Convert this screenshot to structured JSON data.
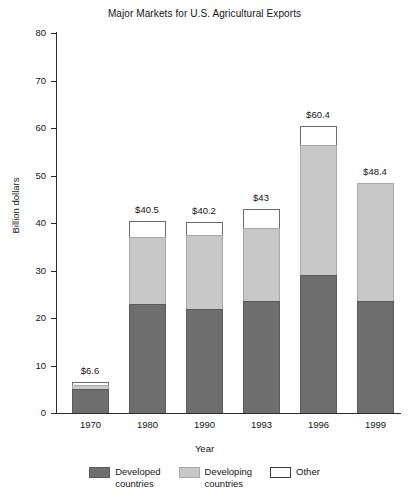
{
  "chart_data": {
    "type": "bar",
    "title": "Major Markets for U.S. Agricultural Exports",
    "xlabel": "Year",
    "ylabel": "Billion dollars",
    "ylim": [
      0,
      80
    ],
    "ytick_step": 10,
    "yticks": [
      "80",
      "70",
      "60",
      "50",
      "40",
      "30",
      "20",
      "10",
      "0"
    ],
    "grid": false,
    "stacked": true,
    "legend_position": "bottom",
    "categories": [
      "1970",
      "1980",
      "1990",
      "1993",
      "1996",
      "1999"
    ],
    "series": [
      {
        "name": "Developed countries",
        "color": "#6e6e6e",
        "values": [
          5.0,
          23.0,
          22.0,
          23.5,
          29.0,
          23.5
        ]
      },
      {
        "name": "Developing countries",
        "color": "#c8c8c8",
        "values": [
          0.9,
          14.0,
          15.5,
          15.5,
          27.5,
          24.9
        ]
      },
      {
        "name": "Other",
        "color": "#ffffff",
        "values": [
          0.7,
          3.5,
          2.7,
          4.0,
          3.9,
          0.0
        ]
      }
    ],
    "totals": [
      6.6,
      40.5,
      40.2,
      43.0,
      60.4,
      48.4
    ],
    "data_labels": [
      "$6.6",
      "$40.5",
      "$40.2",
      "$43",
      "$60.4",
      "$48.4"
    ]
  },
  "legend": {
    "items": [
      {
        "label": "Developed\ncountries",
        "swatch": "dark-gray-swatch"
      },
      {
        "label": "Developing\ncountries",
        "swatch": "light-gray-swatch"
      },
      {
        "label": "Other",
        "swatch": "white-swatch"
      }
    ]
  },
  "colors": {
    "developed": "#6e6e6e",
    "developing": "#c8c8c8",
    "other": "#ffffff",
    "axis": "#2b2b2b",
    "text": "#141414",
    "background": "#ffffff"
  }
}
